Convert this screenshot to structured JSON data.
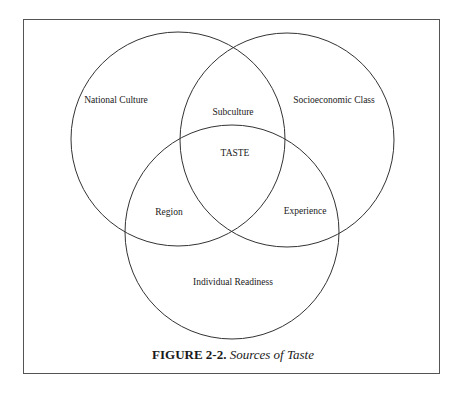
{
  "diagram": {
    "type": "venn",
    "circles": [
      {
        "name": "National Culture",
        "cx": 178,
        "cy": 139,
        "r": 107
      },
      {
        "name": "Socioeconomic Class",
        "cx": 287,
        "cy": 140,
        "r": 107
      },
      {
        "name": "Individual Readiness",
        "cx": 232,
        "cy": 232,
        "r": 107
      }
    ],
    "line_color": "#333333",
    "labels": {
      "national_culture": "National Culture",
      "subculture": "Subculture",
      "socioeconomic_class": "Socioeconomic Class",
      "taste": "TASTE",
      "region": "Region",
      "experience": "Experience",
      "individual_readiness": "Individual Readiness"
    }
  },
  "caption": {
    "number": "FIGURE 2-2.",
    "title": "Sources of Taste"
  }
}
